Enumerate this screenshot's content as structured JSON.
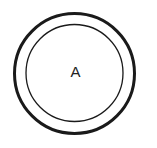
{
  "diagram": {
    "type": "state",
    "state": {
      "label": "A",
      "accepting": true
    },
    "colors": {
      "stroke": "#1a1a1a",
      "background": "#ffffff",
      "label": "#222222"
    }
  }
}
